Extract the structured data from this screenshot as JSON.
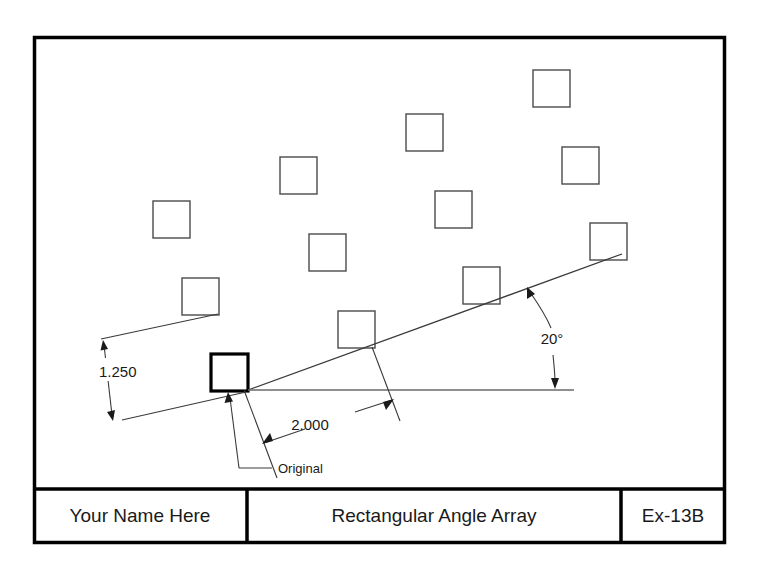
{
  "sheet": {
    "background_color": "#ffffff",
    "border_color": "#000000",
    "line_color": "#3a3a3a",
    "text_color": "#1a1a1a"
  },
  "drawing": {
    "name": "rectangular-angle-array",
    "original_label": "Original",
    "row_spacing_dim": "1.250",
    "column_spacing_dim": "2.000",
    "angle_dim": "20°",
    "array": {
      "rows": 3,
      "columns": 4,
      "angle_degrees": 20,
      "column_spacing": 2.0,
      "row_spacing": 1.25,
      "square_size_px": 37,
      "original_index": 0,
      "squares": [
        {
          "x": 211,
          "y": 354,
          "bold": true,
          "row": 0,
          "col": 0
        },
        {
          "x": 338,
          "y": 311,
          "bold": false,
          "row": 0,
          "col": 1
        },
        {
          "x": 463,
          "y": 267,
          "bold": false,
          "row": 0,
          "col": 2
        },
        {
          "x": 590,
          "y": 223,
          "bold": false,
          "row": 0,
          "col": 3
        },
        {
          "x": 182,
          "y": 278,
          "bold": false,
          "row": 1,
          "col": 0
        },
        {
          "x": 309,
          "y": 234,
          "bold": false,
          "row": 1,
          "col": 1
        },
        {
          "x": 435,
          "y": 191,
          "bold": false,
          "row": 1,
          "col": 2
        },
        {
          "x": 562,
          "y": 147,
          "bold": false,
          "row": 1,
          "col": 3
        },
        {
          "x": 153,
          "y": 201,
          "bold": false,
          "row": 2,
          "col": 0
        },
        {
          "x": 280,
          "y": 157,
          "bold": false,
          "row": 2,
          "col": 1
        },
        {
          "x": 406,
          "y": 114,
          "bold": false,
          "row": 2,
          "col": 2
        },
        {
          "x": 533,
          "y": 70,
          "bold": false,
          "row": 2,
          "col": 3
        }
      ]
    }
  },
  "title_block": {
    "name_field": "Your Name Here",
    "title_field": "Rectangular Angle Array",
    "code_field": "Ex-13B"
  }
}
